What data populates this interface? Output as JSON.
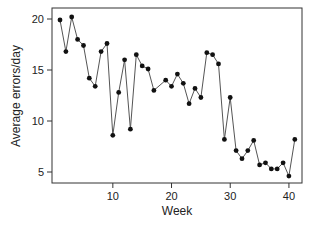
{
  "chart_data": {
    "type": "line",
    "title": "",
    "xlabel": "Week",
    "ylabel": "Average errors/day",
    "xlim": [
      0,
      42
    ],
    "ylim": [
      4,
      21
    ],
    "xticks": [
      10,
      20,
      30,
      40
    ],
    "yticks": [
      5,
      10,
      15,
      20
    ],
    "grid": false,
    "legend": null,
    "markers": true,
    "series": [
      {
        "name": "Average errors/day",
        "x": [
          1,
          2,
          3,
          4,
          5,
          6,
          7,
          8,
          9,
          10,
          11,
          12,
          13,
          14,
          15,
          16,
          17,
          19,
          20,
          21,
          22,
          23,
          24,
          25,
          26,
          27,
          28,
          29,
          30,
          31,
          32,
          33,
          34,
          35,
          36,
          37,
          38,
          39,
          40,
          41
        ],
        "values": [
          19.9,
          16.8,
          20.2,
          18.0,
          17.4,
          14.2,
          13.4,
          16.8,
          17.6,
          8.6,
          12.8,
          16.0,
          9.2,
          16.5,
          15.4,
          15.1,
          13.0,
          14.0,
          13.4,
          14.6,
          13.7,
          11.7,
          13.2,
          12.3,
          16.7,
          16.5,
          15.6,
          8.2,
          12.3,
          7.1,
          6.3,
          7.1,
          8.1,
          5.7,
          5.9,
          5.3,
          5.3,
          5.9,
          4.6,
          8.2
        ]
      }
    ]
  },
  "colors": {
    "line": "#555555",
    "marker": "#111111",
    "axis": "#333333"
  }
}
